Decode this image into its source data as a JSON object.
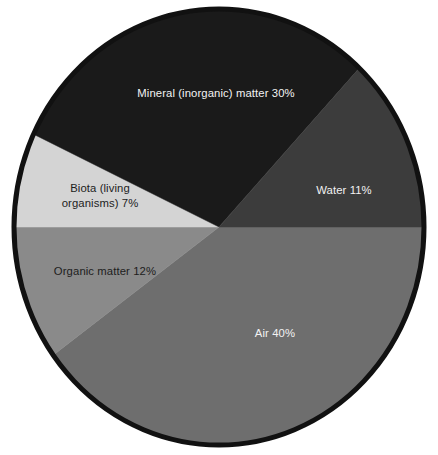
{
  "chart_data": {
    "type": "pie",
    "title": "",
    "subtitle": "",
    "xlabel": "",
    "ylabel": "",
    "legend_position": "none",
    "grid": false,
    "labels_inside_slices": true,
    "total_percent": 100,
    "categories": [
      "Air",
      "Organic matter",
      "Biota (living organisms)",
      "Mineral (inorganic) matter",
      "Water"
    ],
    "values": [
      40,
      12,
      7,
      30,
      11
    ],
    "slices": [
      {
        "name": "Air",
        "value": 40,
        "label": "Air 40%",
        "label_line1": "Air 40%",
        "label_line2": "",
        "color": "#6e6e6e",
        "text_color": "#f2f2f2",
        "start_angle_deg": 0,
        "end_angle_deg": 144
      },
      {
        "name": "Organic matter",
        "value": 12,
        "label": "Organic matter 12%",
        "label_line1": "Organic matter 12%",
        "label_line2": "",
        "color": "#8a8a8a",
        "text_color": "#1d1d1d",
        "start_angle_deg": 144,
        "end_angle_deg": 180
      },
      {
        "name": "Biota (living organisms)",
        "value": 7,
        "label": "Biota (living organisms) 7%",
        "label_line1": "Biota (living",
        "label_line2": "organisms) 7%",
        "color": "#d4d4d4",
        "text_color": "#1d1d1d",
        "start_angle_deg": 180,
        "end_angle_deg": 205.2
      },
      {
        "name": "Mineral (inorganic) matter",
        "value": 30,
        "label": "Mineral (inorganic) matter 30%",
        "label_line1": "Mineral (inorganic) matter 30%",
        "label_line2": "",
        "color": "#1a1a1a",
        "text_color": "#f2f2f2",
        "start_angle_deg": 205.2,
        "end_angle_deg": 313.2
      },
      {
        "name": "Water",
        "value": 11,
        "label": "Water 11%",
        "label_line1": "Water 11%",
        "label_line2": "",
        "color": "#3c3c3c",
        "text_color": "#f2f2f2",
        "start_angle_deg": 313.2,
        "end_angle_deg": 360
      }
    ],
    "border_color": "#111111",
    "background_color": "#ffffff"
  }
}
